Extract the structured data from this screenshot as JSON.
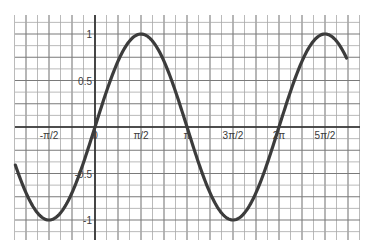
{
  "chart_data": {
    "type": "line",
    "title": "",
    "xlabel": "",
    "ylabel": "",
    "function": "y = sin(x)",
    "series": [
      {
        "name": "sin(x)",
        "color": "#3c3c3c",
        "x_range": [
          -2.72,
          8.59
        ]
      }
    ],
    "x_ticks": [
      {
        "value": -1.5708,
        "label": "-π/2"
      },
      {
        "value": 0,
        "label": "0"
      },
      {
        "value": 1.5708,
        "label": "π/2"
      },
      {
        "value": 3.1416,
        "label": "π"
      },
      {
        "value": 4.7124,
        "label": "3π/2"
      },
      {
        "value": 6.2832,
        "label": "2π"
      },
      {
        "value": 7.854,
        "label": "5π/2"
      }
    ],
    "y_ticks": [
      {
        "value": 1,
        "label": "1"
      },
      {
        "value": 0.5,
        "label": "0.5"
      },
      {
        "value": -0.5,
        "label": "-0.5"
      },
      {
        "value": -1,
        "label": "-1"
      }
    ],
    "xlim": [
      -2.72,
      8.59
    ],
    "ylim": [
      -1.22,
      1.2
    ],
    "grid": true,
    "legend": "none"
  },
  "layout": {
    "origin_px": [
      95,
      127
    ],
    "px_per_half_pi": 46,
    "px_per_unit_y": 93,
    "grid_left": 15,
    "grid_right": 360,
    "grid_top": 15,
    "grid_bottom": 240
  }
}
